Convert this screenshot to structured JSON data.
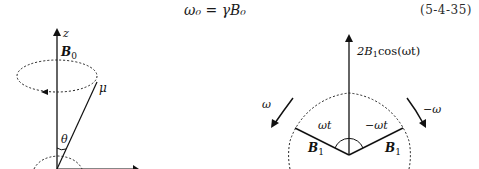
{
  "equation": {
    "text": "ω₀ = γB₀",
    "number": "(5-4-35)"
  },
  "left_figure": {
    "axis_label": "z",
    "field_label": "B",
    "field_subscript": "0",
    "moment_label": "μ",
    "angle_label": "θ"
  },
  "right_figure": {
    "resultant_label_prefix": "2B",
    "resultant_label_sub": "1",
    "resultant_label_suffix": "cos(ωt)",
    "left_rotation_label": "ω",
    "right_rotation_label": "−ω",
    "left_angle_label": "ωt",
    "right_angle_label": "−ωt",
    "left_vector_label": "B",
    "right_vector_label": "B",
    "vector_subscript": "1"
  },
  "colors": {
    "ink": "#111111",
    "background": "#ffffff"
  }
}
